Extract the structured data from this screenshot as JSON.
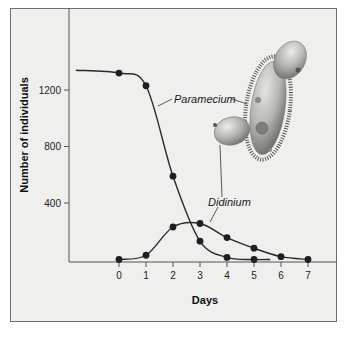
{
  "chart_data": {
    "type": "line",
    "title": "",
    "xlabel": "Days",
    "ylabel": "Number of individuals",
    "x": [
      0,
      1,
      2,
      3,
      4,
      5,
      6,
      7
    ],
    "x_tick_labels": [
      "0",
      "1",
      "2",
      "3",
      "4",
      "5",
      "6",
      "7"
    ],
    "y_tick_labels": [
      "400",
      "800",
      "1200"
    ],
    "y_ticks": [
      400,
      800,
      1200
    ],
    "ylim": [
      0,
      1700
    ],
    "xlim": [
      -1.85,
      8.1
    ],
    "grid": false,
    "legend": "inline labels",
    "series": [
      {
        "name": "Paramecium",
        "x": [
          0,
          1,
          2,
          3,
          4,
          5
        ],
        "values": [
          1320,
          1230,
          590,
          130,
          15,
          0
        ],
        "curve_start": {
          "x": -1.6,
          "y": 1340
        }
      },
      {
        "name": "Didinium",
        "x": [
          0,
          1,
          2,
          3,
          4,
          5,
          6,
          7
        ],
        "values": [
          0,
          30,
          230,
          255,
          155,
          80,
          20,
          0
        ]
      }
    ],
    "annotations": [
      {
        "text": "Paramecium",
        "style": "italic",
        "points_to": "Paramecium curve and illustration"
      },
      {
        "text": "Didinium",
        "style": "italic",
        "points_to": "Didinium curve and illustration"
      },
      {
        "text": "illustration of Didinium organisms attacking a Paramecium",
        "type": "image"
      }
    ]
  },
  "labels": {
    "x_axis_title": "Days",
    "y_axis_title": "Number of individuals",
    "paramecium": "Paramecium",
    "didinium": "Didinium"
  },
  "colors": {
    "background": "#efefed",
    "frame": "#6d6d6d",
    "line": "#2a2a2a",
    "marker": "#1e1e1e",
    "organism_body": "#b8b8b4",
    "organism_shadow": "#7a7a76"
  }
}
